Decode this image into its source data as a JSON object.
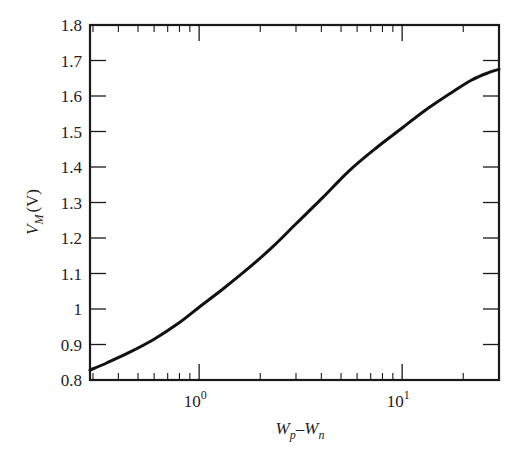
{
  "chart_data": {
    "type": "line",
    "title": "",
    "xlabel": "W_p–W_n",
    "xlabel_parts": {
      "main1": "W",
      "sub1": "p",
      "dash": "–",
      "main2": "W",
      "sub2": "n"
    },
    "ylabel": "V_M (V)",
    "ylabel_parts": {
      "main": "V",
      "sub": "M",
      "unit": "(V)"
    },
    "xscale": "log",
    "xlim": [
      0.29,
      30
    ],
    "ylim": [
      0.8,
      1.8
    ],
    "grid": false,
    "legend": null,
    "x_major_ticks": [
      {
        "value": 1,
        "base": "10",
        "exp": "0"
      },
      {
        "value": 10,
        "base": "10",
        "exp": "1"
      }
    ],
    "x_minor_ticks": [
      0.3,
      0.4,
      0.5,
      0.6,
      0.7,
      0.8,
      0.9,
      2,
      3,
      4,
      5,
      6,
      7,
      8,
      9,
      20
    ],
    "y_ticks": [
      "0.8",
      "0.9",
      "1",
      "1.1",
      "1.2",
      "1.3",
      "1.4",
      "1.5",
      "1.6",
      "1.7",
      "1.8"
    ],
    "series": [
      {
        "name": "V_M",
        "color": "#111111",
        "x": [
          0.29,
          0.35,
          0.45,
          0.6,
          0.8,
          1.0,
          1.3,
          1.75,
          2.3,
          3.0,
          4.0,
          5.5,
          7.5,
          10,
          13,
          17,
          22,
          27,
          30
        ],
        "y": [
          0.828,
          0.848,
          0.877,
          0.915,
          0.962,
          1.005,
          1.055,
          1.115,
          1.175,
          1.24,
          1.31,
          1.39,
          1.455,
          1.51,
          1.56,
          1.605,
          1.645,
          1.667,
          1.675
        ]
      }
    ]
  }
}
